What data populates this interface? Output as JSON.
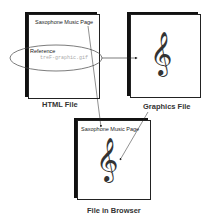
{
  "html_file": {
    "page_title": "Saxophone Music Page",
    "reference_label": "Reference",
    "reference_filename": "treF-graphic.gif",
    "caption": "HTML File"
  },
  "graphics_file": {
    "icon": "treble-clef-icon",
    "glyph": "𝄞",
    "caption": "Graphics File"
  },
  "browser_file": {
    "page_title": "Saxophone Music Page",
    "glyph": "𝄞",
    "caption": "File in Browser"
  }
}
